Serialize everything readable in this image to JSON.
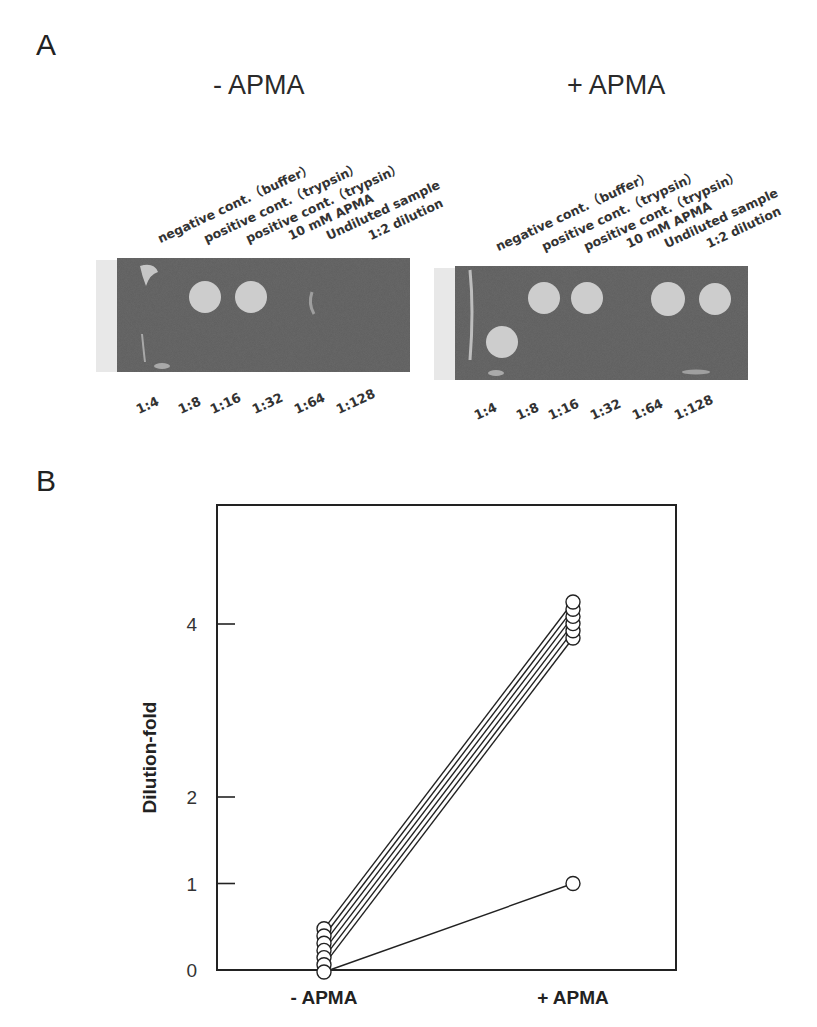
{
  "panel_a": {
    "letter": "A",
    "groups": [
      {
        "title": "- APMA",
        "lane_labels": [
          "negative cont.（buffer）",
          "positive cont.（trypsin）",
          "positive cont.（trypsin）",
          "10 mM APMA",
          "Undiluted sample",
          "1:2 dilution"
        ],
        "dilution_labels": [
          "1:4",
          "1:8",
          "1:16",
          "1:32",
          "1:64",
          "1:128"
        ],
        "spots_visible": [
          "positive cont. (trypsin)",
          "positive cont. (trypsin)"
        ]
      },
      {
        "title": "+ APMA",
        "lane_labels": [
          "negative cont.（buffer）",
          "positive cont.（trypsin）",
          "positive cont.（trypsin）",
          "10 mM APMA",
          "Undiluted sample",
          "1:2 dilution"
        ],
        "dilution_labels": [
          "1:4",
          "1:8",
          "1:16",
          "1:32",
          "1:64",
          "1:128"
        ],
        "spots_visible": [
          "positive cont. (trypsin)",
          "positive cont. (trypsin)",
          "Undiluted sample",
          "1:2 dilution",
          "1:4"
        ]
      }
    ],
    "colors": {
      "gel": "#5e5e5e",
      "spot": "#cdcdcd"
    }
  },
  "panel_b": {
    "letter": "B"
  },
  "chart_data": {
    "type": "line",
    "title": "",
    "xlabel": "",
    "ylabel": "Dilution-fold",
    "categories": [
      "- APMA",
      "+ APMA"
    ],
    "yticks": [
      0,
      1,
      2,
      4
    ],
    "ylim": [
      0,
      5.5
    ],
    "grid": false,
    "legend": null,
    "marker": "open-circle",
    "series": [
      {
        "name": "sample 1",
        "values": [
          0,
          4
        ]
      },
      {
        "name": "sample 2",
        "values": [
          0,
          4
        ]
      },
      {
        "name": "sample 3",
        "values": [
          0,
          4
        ]
      },
      {
        "name": "sample 4",
        "values": [
          0,
          4
        ]
      },
      {
        "name": "sample 5",
        "values": [
          0,
          4
        ]
      },
      {
        "name": "sample 6",
        "values": [
          0,
          4
        ]
      },
      {
        "name": "sample 7",
        "values": [
          0,
          1
        ]
      }
    ]
  }
}
